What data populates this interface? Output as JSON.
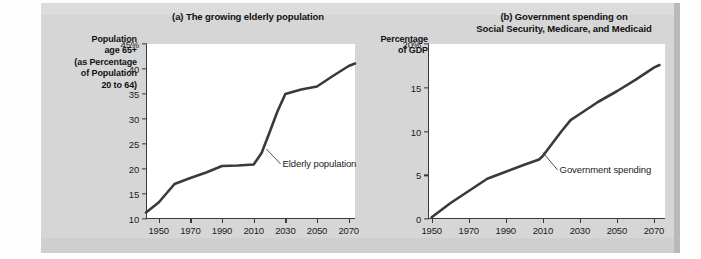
{
  "figure": {
    "background_color": "#d6d6d6",
    "plot_background_color": "#ffffff",
    "line_color": "#3a3a3a",
    "axis_color": "#3a3a3a"
  },
  "chart_data": [
    {
      "type": "line",
      "panel": "(a)",
      "title": "(a) The growing elderly population",
      "ylabel": "Population\nage 65+\n(as Percentage\nof Population\n20 to 64)",
      "ylabel_lines": [
        "Population",
        "age 65+",
        "(as Percentage",
        "of Population",
        "20 to 64)"
      ],
      "xlabel": "",
      "ylim": [
        10,
        45
      ],
      "xlim": [
        1942,
        2074
      ],
      "yticks": [
        10,
        15,
        20,
        25,
        30,
        35,
        40,
        45
      ],
      "ytick_labels": [
        "10",
        "15",
        "20",
        "25",
        "30",
        "35",
        "40",
        "45%"
      ],
      "xticks": [
        1950,
        1970,
        1990,
        2010,
        2030,
        2050,
        2070
      ],
      "xtick_labels": [
        "1950",
        "1970",
        "1990",
        "2010",
        "2030",
        "2050",
        "2070"
      ],
      "grid": false,
      "legend": "none",
      "series": [
        {
          "name": "Elderly population",
          "x": [
            1942,
            1950,
            1960,
            1970,
            1980,
            1990,
            2000,
            2010,
            2015,
            2020,
            2025,
            2030,
            2040,
            2050,
            2060,
            2070,
            2074
          ],
          "values": [
            11.3,
            13.3,
            17.0,
            18.2,
            19.3,
            20.6,
            20.7,
            20.9,
            23.2,
            27.3,
            31.5,
            35.0,
            35.9,
            36.5,
            38.6,
            40.6,
            41.1
          ]
        }
      ],
      "annotations": [
        {
          "text": "Elderly population",
          "anchor_x": 2018,
          "anchor_y": 24.0,
          "label_x": 2027,
          "label_y": 21.0
        }
      ]
    },
    {
      "type": "line",
      "panel": "(b)",
      "title_lines": [
        "(b) Government spending on",
        "Social Security, Medicare, and Medicaid"
      ],
      "title": "(b) Government spending on Social Security, Medicare, and Medicaid",
      "ylabel_lines": [
        "Percentage",
        "of GDP"
      ],
      "ylabel": "Percentage\nof GDP",
      "xlabel": "",
      "ylim": [
        0,
        20
      ],
      "xlim": [
        1948,
        2076
      ],
      "yticks": [
        0,
        5,
        10,
        15,
        20
      ],
      "ytick_labels": [
        "0",
        "5",
        "10",
        "15",
        "20%"
      ],
      "xticks": [
        1950,
        1970,
        1990,
        2010,
        2030,
        2050,
        2070
      ],
      "xtick_labels": [
        "1950",
        "1970",
        "1990",
        "2010",
        "2030",
        "2050",
        "2070"
      ],
      "grid": false,
      "legend": "none",
      "series": [
        {
          "name": "Government spending",
          "x": [
            1950,
            1955,
            1960,
            1970,
            1980,
            1985,
            1990,
            2000,
            2008,
            2010,
            2015,
            2020,
            2025,
            2030,
            2040,
            2050,
            2060,
            2070,
            2073
          ],
          "values": [
            0.2,
            1.0,
            1.8,
            3.2,
            4.6,
            5.0,
            5.4,
            6.2,
            6.8,
            7.2,
            8.6,
            10.0,
            11.3,
            12.0,
            13.4,
            14.6,
            15.9,
            17.3,
            17.6
          ]
        }
      ],
      "annotations": [
        {
          "text": "Government spending",
          "anchor_x": 2010,
          "anchor_y": 7.6,
          "label_x": 2018,
          "label_y": 5.6
        }
      ]
    }
  ]
}
